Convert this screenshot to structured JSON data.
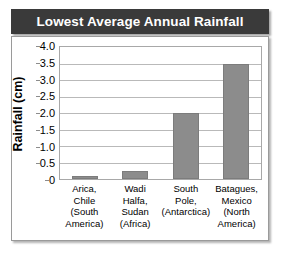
{
  "title": "Lowest Average Annual Rainfall",
  "colors": {
    "title_bar_background": "#3a3a3a",
    "title_text": "#ffffff",
    "bar_fill": "#8c8c8c",
    "bar_border": "#7c7c7c",
    "gridline": "#b9b9b9",
    "plot_border": "#a8a8a8",
    "frame_border": "#9a9a9a",
    "page_background": "#ffffff"
  },
  "axes": {
    "y_title": "Rainfall (cm)",
    "y_ticks": [
      "4.0",
      "3.5",
      "3.0",
      "2.5",
      "2.0",
      "1.5",
      "1.0",
      "0.5",
      "0"
    ]
  },
  "chart_data": {
    "type": "bar",
    "title": "Lowest Average Annual Rainfall",
    "xlabel": "",
    "ylabel": "Rainfall (cm)",
    "ylim": [
      0,
      4.0
    ],
    "ytick_step": 0.5,
    "grid": true,
    "legend": false,
    "categories": [
      "Arica, Chile (South America)",
      "Wadi Halfa, Sudan (Africa)",
      "South Pole, (Antarctica)",
      "Batagues, Mexico (North America)"
    ],
    "category_lines": [
      [
        "Arica,",
        "Chile",
        "(South",
        "America)"
      ],
      [
        "Wadi",
        "Halfa,",
        "Sudan",
        "(Africa)"
      ],
      [
        "South",
        "Pole,",
        "(Antarctica)"
      ],
      [
        "Batagues,",
        "Mexico",
        "(North",
        "America)"
      ]
    ],
    "values": [
      0.1,
      0.25,
      2.0,
      3.5
    ]
  }
}
